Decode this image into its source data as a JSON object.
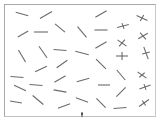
{
  "display": {
    "type": "visual-search-stimulus",
    "line_color": "#6a6a6a",
    "frame_color": "#a8a8a8",
    "background": "#ffffff"
  },
  "stimuli": {
    "segments": [
      {
        "x": 22,
        "y": 14,
        "angle": 15,
        "len": 13
      },
      {
        "x": 46,
        "y": 15,
        "angle": -30,
        "len": 14
      },
      {
        "x": 101,
        "y": 14,
        "angle": -30,
        "len": 13
      },
      {
        "x": 23,
        "y": 34,
        "angle": -30,
        "len": 12
      },
      {
        "x": 41,
        "y": 32,
        "angle": 0,
        "len": 14
      },
      {
        "x": 60,
        "y": 28,
        "angle": 40,
        "len": 13
      },
      {
        "x": 82,
        "y": 32,
        "angle": 50,
        "len": 14
      },
      {
        "x": 101,
        "y": 30,
        "angle": 0,
        "len": 13
      },
      {
        "x": 22,
        "y": 56,
        "angle": 60,
        "len": 14
      },
      {
        "x": 43,
        "y": 52,
        "angle": 55,
        "len": 14
      },
      {
        "x": 60,
        "y": 50,
        "angle": 5,
        "len": 13
      },
      {
        "x": 82,
        "y": 53,
        "angle": 15,
        "len": 14
      },
      {
        "x": 101,
        "y": 45,
        "angle": -30,
        "len": 13
      },
      {
        "x": 41,
        "y": 69,
        "angle": -25,
        "len": 13
      },
      {
        "x": 62,
        "y": 64,
        "angle": -35,
        "len": 13
      },
      {
        "x": 101,
        "y": 64,
        "angle": 45,
        "len": 14
      },
      {
        "x": 121,
        "y": 75,
        "angle": 50,
        "len": 13
      },
      {
        "x": 17,
        "y": 77,
        "angle": 5,
        "len": 13
      },
      {
        "x": 60,
        "y": 79,
        "angle": -30,
        "len": 13
      },
      {
        "x": 83,
        "y": 80,
        "angle": -15,
        "len": 13
      },
      {
        "x": 36,
        "y": 85,
        "angle": 5,
        "len": 13
      },
      {
        "x": 104,
        "y": 85,
        "angle": 0,
        "len": 12
      },
      {
        "x": 20,
        "y": 88,
        "angle": 25,
        "len": 13
      },
      {
        "x": 60,
        "y": 91,
        "angle": 10,
        "len": 13
      },
      {
        "x": 121,
        "y": 92,
        "angle": -45,
        "len": 13
      },
      {
        "x": 38,
        "y": 100,
        "angle": 40,
        "len": 14
      },
      {
        "x": 16,
        "y": 102,
        "angle": 10,
        "len": 12
      },
      {
        "x": 82,
        "y": 100,
        "angle": 20,
        "len": 13
      },
      {
        "x": 101,
        "y": 103,
        "angle": 45,
        "len": 13
      },
      {
        "x": 64,
        "y": 106,
        "angle": -20,
        "len": 13
      },
      {
        "x": 120,
        "y": 108,
        "angle": -5,
        "len": 13
      }
    ],
    "crosses": [
      {
        "x": 142,
        "y": 18,
        "a1": 25,
        "a2": -60,
        "len": 12,
        "len2": 7
      },
      {
        "x": 123,
        "y": 26,
        "a1": -15,
        "a2": 70,
        "len": 12,
        "len2": 6
      },
      {
        "x": 143,
        "y": 36,
        "a1": -30,
        "a2": 50,
        "len": 11,
        "len2": 9
      },
      {
        "x": 122,
        "y": 43,
        "a1": 35,
        "a2": -50,
        "len": 11,
        "len2": 9
      },
      {
        "x": 122,
        "y": 56,
        "a1": 0,
        "a2": 90,
        "len": 12,
        "len2": 8
      },
      {
        "x": 146,
        "y": 53,
        "a1": 70,
        "a2": -15,
        "len": 13,
        "len2": 8
      },
      {
        "x": 142,
        "y": 75,
        "a1": 35,
        "a2": -40,
        "len": 11,
        "len2": 7
      },
      {
        "x": 145,
        "y": 87,
        "a1": -20,
        "a2": 70,
        "len": 12,
        "len2": 6
      },
      {
        "x": 144,
        "y": 103,
        "a1": -35,
        "a2": 55,
        "len": 12,
        "len2": 6
      }
    ]
  },
  "fixation_marker": {
    "x": 82,
    "y": 115,
    "label": "fixation-marker"
  }
}
